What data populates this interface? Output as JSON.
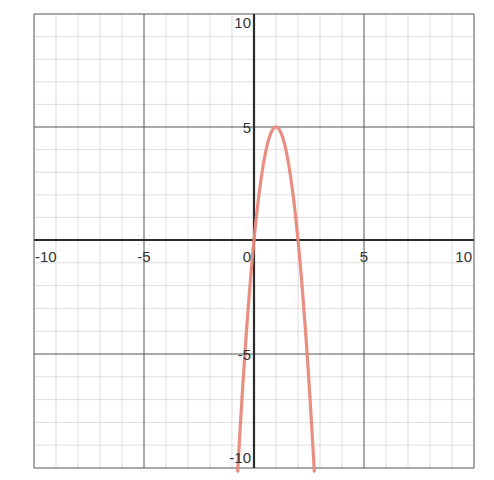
{
  "chart_data": {
    "type": "line",
    "title": "",
    "xlabel": "",
    "ylabel": "",
    "xlim": [
      -10,
      10
    ],
    "ylim": [
      -10,
      10
    ],
    "grid": true,
    "minor_grid_step": 1,
    "major_grid_step": 5,
    "x_tick_labels": [
      "-10",
      "-5",
      "0",
      "5",
      "10"
    ],
    "y_tick_labels": [
      "10",
      "5",
      "-5",
      "-10"
    ],
    "series": [
      {
        "name": "y = -5x^2 + 10x",
        "equation": "y = -5x^2 + 10x",
        "color": "#e8887a",
        "vertex": [
          1,
          5
        ],
        "x_intercepts": [
          0,
          2
        ],
        "x": [
          -0.73,
          -0.5,
          0,
          0.25,
          0.5,
          0.75,
          1,
          1.25,
          1.5,
          1.75,
          2,
          2.5,
          2.73
        ],
        "values": [
          -10,
          -6.25,
          0,
          2.19,
          3.75,
          4.69,
          5,
          4.69,
          3.75,
          2.19,
          0,
          -6.25,
          -10
        ]
      }
    ]
  },
  "colors": {
    "axis": "#2b2b2b",
    "major_grid": "#555555",
    "minor_grid": "#d4d4d4",
    "curve": "#e8887a",
    "background": "#ffffff"
  }
}
